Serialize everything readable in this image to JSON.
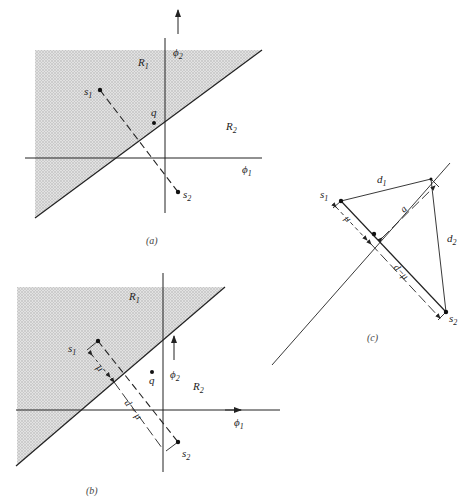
{
  "figure": {
    "panels": [
      {
        "id": "a",
        "caption": "(a)",
        "labels": {
          "region1": "R",
          "region1_sub": "1",
          "region2": "R",
          "region2_sub": "2",
          "axis_x": "ϕ",
          "axis_x_sub": "1",
          "axis_y": "ϕ",
          "axis_y_sub": "2",
          "s1": "s",
          "s1_sub": "1",
          "s2": "s",
          "s2_sub": "2",
          "q": "q"
        }
      },
      {
        "id": "b",
        "caption": "(b)",
        "labels": {
          "region1": "R",
          "region1_sub": "1",
          "region2": "R",
          "region2_sub": "2",
          "axis_x": "ϕ",
          "axis_x_sub": "1",
          "axis_y": "ϕ",
          "axis_y_sub": "2",
          "s1": "s",
          "s1_sub": "1",
          "s2": "s",
          "s2_sub": "2",
          "q": "q",
          "mu": "μ",
          "d_minus_mu": "d − μ"
        }
      },
      {
        "id": "c",
        "caption": "(c)",
        "labels": {
          "s1": "s",
          "s1_sub": "1",
          "s2": "s",
          "s2_sub": "2",
          "d1": "d",
          "d1_sub": "1",
          "d2": "d",
          "d2_sub": "2",
          "a": "a",
          "mu": "μ",
          "d_minus_mu": "d−μ"
        }
      }
    ],
    "colors": {
      "shade": "#cfcfcf",
      "ink": "#222222"
    }
  }
}
